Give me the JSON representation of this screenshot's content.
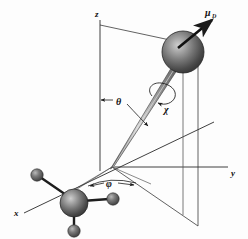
{
  "figure": {
    "background_color": "#fdfdfd",
    "ink_color": "#1a1a1a"
  },
  "axes": {
    "z_label": "z",
    "y_label": "y",
    "x_label": "x"
  },
  "angles": {
    "theta_label": "θ",
    "phi_label": "φ",
    "chi_label": "χ"
  },
  "vectors": {
    "moment_symbol": "μ",
    "moment_subscript": "D",
    "moment_label": "μD"
  },
  "spheres": [
    {
      "name": "top-atom",
      "cx": 183,
      "cy": 52,
      "r": 21,
      "shade": "dark-gray"
    },
    {
      "name": "central-atom",
      "cx": 74,
      "cy": 203,
      "r": 14,
      "shade": "dark-gray"
    },
    {
      "name": "ligand-upper-left",
      "cx": 37,
      "cy": 175,
      "r": 6,
      "shade": "dark-gray"
    },
    {
      "name": "ligand-right",
      "cx": 113,
      "cy": 199,
      "r": 6,
      "shade": "dark-gray"
    },
    {
      "name": "ligand-lower",
      "cx": 74,
      "cy": 231,
      "r": 6,
      "shade": "dark-gray"
    }
  ],
  "geometry": {
    "origin": {
      "x": 112,
      "y": 167
    },
    "vertical_plane": "quadrilateral through z-axis and the figure axis projection",
    "rotation_arrow": "ellipse with arrowhead indicating spin chi about the figure axis"
  }
}
